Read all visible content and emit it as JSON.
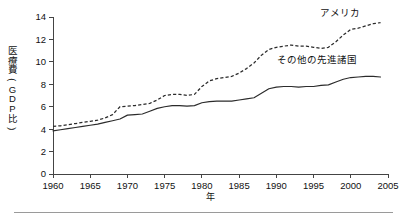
{
  "chart_data": {
    "type": "line",
    "title": "",
    "xlabel": "年",
    "ylabel": "医療費(GDP比)",
    "ylabel_chars": [
      "医",
      "療",
      "費",
      "(",
      "G",
      "D",
      "P",
      "比",
      ")"
    ],
    "xlim": [
      1960,
      2005
    ],
    "ylim": [
      0,
      14
    ],
    "ytick_step": 2,
    "xtick_step": 5,
    "grid": false,
    "legend_position": "inline-annotation",
    "xticks": [
      1960,
      1965,
      1970,
      1975,
      1980,
      1985,
      1990,
      1995,
      2000,
      2005
    ],
    "yticks": [
      0,
      2,
      4,
      6,
      8,
      10,
      12,
      14
    ],
    "x": [
      1960,
      1961,
      1962,
      1963,
      1964,
      1965,
      1966,
      1967,
      1968,
      1969,
      1970,
      1971,
      1972,
      1973,
      1974,
      1975,
      1976,
      1977,
      1978,
      1979,
      1980,
      1981,
      1982,
      1983,
      1984,
      1985,
      1986,
      1987,
      1988,
      1989,
      1990,
      1991,
      1992,
      1993,
      1994,
      1995,
      1996,
      1997,
      1998,
      1999,
      2000,
      2001,
      2002,
      2003,
      2004
    ],
    "series": [
      {
        "name": "アメリカ",
        "style": "dashed",
        "label_text": "アメリカ",
        "values": [
          4.25,
          4.3,
          4.4,
          4.5,
          4.6,
          4.7,
          4.8,
          5.0,
          5.3,
          6.0,
          6.05,
          6.1,
          6.2,
          6.3,
          6.6,
          7.0,
          7.1,
          7.1,
          7.0,
          7.1,
          7.8,
          8.3,
          8.5,
          8.6,
          8.7,
          9.0,
          9.4,
          9.9,
          10.6,
          11.1,
          11.3,
          11.4,
          11.5,
          11.4,
          11.4,
          11.3,
          11.2,
          11.3,
          11.8,
          12.4,
          12.9,
          13.0,
          13.2,
          13.4,
          13.5
        ]
      },
      {
        "name": "その他の先進諸国",
        "style": "solid",
        "label_text": "その他の先進諸国",
        "values": [
          3.85,
          3.95,
          4.05,
          4.15,
          4.25,
          4.35,
          4.45,
          4.6,
          4.75,
          4.9,
          5.25,
          5.3,
          5.35,
          5.6,
          5.85,
          6.0,
          6.1,
          6.1,
          6.05,
          6.1,
          6.35,
          6.45,
          6.5,
          6.5,
          6.5,
          6.6,
          6.7,
          6.8,
          7.2,
          7.6,
          7.75,
          7.8,
          7.8,
          7.75,
          7.8,
          7.8,
          7.9,
          7.95,
          8.2,
          8.45,
          8.6,
          8.65,
          8.7,
          8.7,
          8.65
        ]
      }
    ],
    "annotations": [
      {
        "text": "アメリカ",
        "x": 1998.5,
        "y": 14.1
      },
      {
        "text": "その他の先進諸国",
        "x": 1995.5,
        "y": 9.9
      }
    ],
    "colors": {
      "line": "#2b2b2b",
      "axis": "#444444",
      "text": "#111111",
      "background": "#ffffff",
      "footer_rule": "#9a9a9a"
    }
  }
}
